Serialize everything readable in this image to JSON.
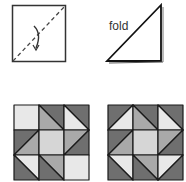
{
  "diagram": {
    "step1": {
      "name": "square-with-fold-line"
    },
    "step2": {
      "name": "folded-triangle",
      "label": "fold"
    },
    "colors": {
      "dark": "#6f6f6f",
      "mid": "#a9a9a9",
      "light": "#e8e8e8",
      "center": "#d6d6d6",
      "stroke": "#1a1a1a"
    },
    "blocks": [
      {
        "name": "quilt-block-1",
        "cells": [
          [
            {
              "type": "solid",
              "fill": "light"
            },
            {
              "type": "tlbr",
              "a": "dark",
              "b": "mid"
            },
            {
              "type": "tlbr",
              "a": "dark",
              "b": "light"
            }
          ],
          [
            {
              "type": "bltr",
              "a": "dark",
              "b": "mid"
            },
            {
              "type": "solid",
              "fill": "center"
            },
            {
              "type": "trbl",
              "a": "mid",
              "b": "dark"
            }
          ],
          [
            {
              "type": "tlbr",
              "a": "light",
              "b": "dark"
            },
            {
              "type": "tlbr",
              "a": "mid",
              "b": "dark"
            },
            {
              "type": "solid",
              "fill": "light"
            }
          ]
        ]
      },
      {
        "name": "quilt-block-2",
        "cells": [
          [
            {
              "type": "bltr",
              "a": "dark",
              "b": "light"
            },
            {
              "type": "tlbr",
              "a": "dark",
              "b": "mid"
            },
            {
              "type": "tlbr",
              "a": "dark",
              "b": "light"
            }
          ],
          [
            {
              "type": "bltr",
              "a": "dark",
              "b": "mid"
            },
            {
              "type": "solid",
              "fill": "center"
            },
            {
              "type": "trbl",
              "a": "mid",
              "b": "dark"
            }
          ],
          [
            {
              "type": "tlbr",
              "a": "light",
              "b": "dark"
            },
            {
              "type": "tlbr",
              "a": "mid",
              "b": "dark"
            },
            {
              "type": "trbl",
              "a": "light",
              "b": "dark"
            }
          ]
        ]
      }
    ]
  }
}
